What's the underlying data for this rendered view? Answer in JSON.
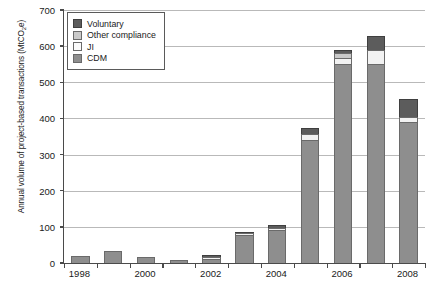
{
  "chart_data": {
    "type": "bar",
    "stacked": true,
    "title": "",
    "xlabel": "",
    "ylabel": "Annual volume of project-based transactions (MtCO2e)",
    "ylabel_parts": {
      "before": "Annual volume of project-based transactions (MtCO",
      "sub": "2",
      "after": "e)"
    },
    "ylim": [
      0,
      700
    ],
    "yticks": [
      0,
      100,
      200,
      300,
      400,
      500,
      600,
      700
    ],
    "ytick_labels": [
      "0",
      "100",
      "200",
      "300",
      "400",
      "500",
      "600",
      "700"
    ],
    "grid": true,
    "legend_position": "upper-left-inside",
    "categories": [
      "1998",
      "1999",
      "2000",
      "2001",
      "2002",
      "2003",
      "2004",
      "2005",
      "2006",
      "2007",
      "2008"
    ],
    "xtick_labels_shown": [
      "1998",
      "2000",
      "2002",
      "2004",
      "2006",
      "2008"
    ],
    "series": [
      {
        "name": "CDM",
        "color": "#8e8e8e",
        "values": [
          19,
          32,
          17,
          9,
          12,
          77,
          92,
          341,
          552,
          552,
          389
        ]
      },
      {
        "name": "JI",
        "color": "#f2f2f2",
        "values": [
          0,
          0,
          0,
          0,
          5,
          5,
          5,
          16,
          16,
          37,
          15
        ]
      },
      {
        "name": "Other compliance",
        "color": "#c9c9c9",
        "values": [
          0,
          0,
          0,
          0,
          0,
          0,
          0,
          0,
          12,
          0,
          0
        ]
      },
      {
        "name": "Voluntary",
        "color": "#5c5c5c",
        "values": [
          0,
          0,
          0,
          0,
          5,
          5,
          7,
          17,
          10,
          38,
          51
        ]
      }
    ],
    "totals": [
      19,
      32,
      17,
      9,
      22,
      87,
      104,
      374,
      590,
      627,
      455
    ]
  },
  "legend": {
    "items": [
      {
        "label": "Voluntary",
        "swatch": "vol"
      },
      {
        "label": "Other compliance",
        "swatch": "other"
      },
      {
        "label": "JI",
        "swatch": "ji"
      },
      {
        "label": "CDM",
        "swatch": "cdm"
      }
    ]
  }
}
